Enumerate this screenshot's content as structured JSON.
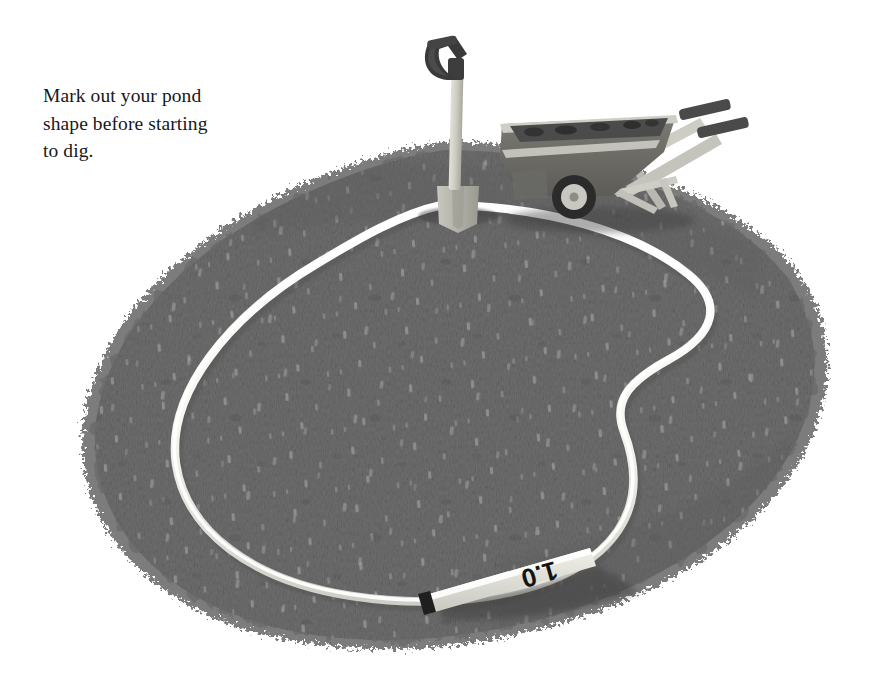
{
  "page": {
    "background_color": "#ffffff",
    "width": 881,
    "height": 687,
    "kind": "instructional-illustration"
  },
  "caption": {
    "text": "Mark out your pond\nshape before starting\nto dig.",
    "lines": [
      "Mark out your pond",
      "shape before starting",
      "to dig."
    ],
    "color": "#17181a"
  },
  "illustration": {
    "title": "Garden pond outline marked with rope on bare soil",
    "palette": {
      "background": "#ffffff",
      "soil_mid": "#6e6e6e",
      "soil_dark": "#5a5a5a",
      "soil_darkest": "#3d3d3d",
      "soil_speckle": "#9d9d9d",
      "rope_light": "#fcfcfa",
      "rope_shade": "#d9d8d2",
      "metal_light": "#d6d5ce",
      "metal_mid": "#b6b5ad",
      "metal_dark": "#8a8982",
      "grip_dark": "#3c3c3c",
      "shadow": "#4a4a4a",
      "tape_body": "#e8e7df",
      "tape_mark": "#1c1c1c"
    },
    "objects": [
      {
        "name": "soil-mound",
        "label": "Excavated bare soil / turf-stripped ground",
        "shape": "ragged oval",
        "fill": "#6e6e6e"
      },
      {
        "name": "marking-rope",
        "label": "White rope laid out as pond outline",
        "shape": "kidney / bean outline with S-curve notch on right",
        "fill": "#fcfcfa"
      },
      {
        "name": "spade",
        "label": "Garden spade stuck upright in the soil",
        "parts": [
          "d-handle",
          "wooden-shaft",
          "metal-blade"
        ]
      },
      {
        "name": "wheelbarrow",
        "label": "Wheelbarrow loaded with soil",
        "parts": [
          "tray",
          "soil-load",
          "wheel",
          "legs",
          "handles",
          "grips"
        ]
      },
      {
        "name": "tape-measure",
        "label": "Tape measure lying on the soil at the pond edge",
        "marking": "1.0"
      }
    ]
  },
  "tape_measure": {
    "reading": "1.0",
    "orientation": "upside-down"
  }
}
